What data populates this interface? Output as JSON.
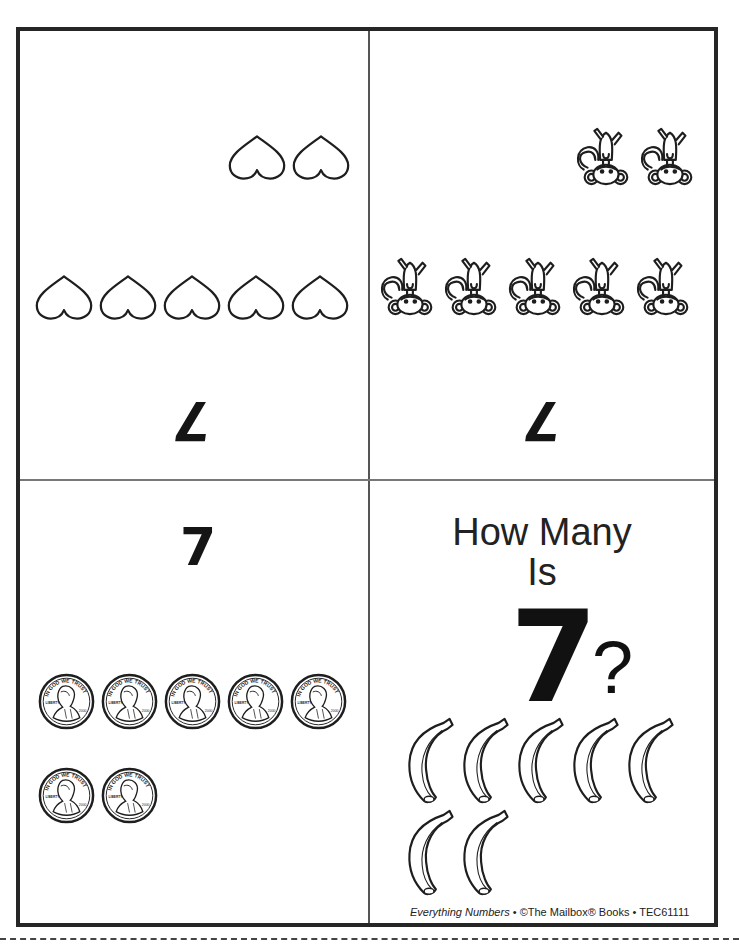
{
  "page": {
    "type": "printable counting book pages",
    "number": "7",
    "cut_line": "dashed"
  },
  "panels": {
    "top_left": {
      "orientation": "upside-down",
      "item": "heart",
      "item_icon": "heart-outline-icon",
      "rows": [
        2,
        5
      ],
      "count": 7,
      "numeral": "7"
    },
    "top_right": {
      "orientation": "upside-down",
      "item": "monkey",
      "item_icon": "monkey-icon",
      "rows": [
        2,
        5
      ],
      "count": 7,
      "numeral": "7"
    },
    "bottom_left": {
      "orientation": "upright",
      "numeral": "7",
      "item": "penny",
      "item_icon": "penny-coin-icon",
      "coin_text_top": "IN GOD WE TRUST",
      "coin_text_left": "LIBERTY",
      "coin_text_year": "2000",
      "rows": [
        5,
        2
      ],
      "count": 7
    },
    "bottom_right": {
      "orientation": "upright",
      "title_line1": "How Many",
      "title_line2": "Is",
      "numeral": "7",
      "question_mark": "?",
      "item": "banana",
      "item_icon": "banana-icon",
      "rows": [
        5,
        2
      ],
      "count": 7
    }
  },
  "footer": {
    "book_title": "Everything Numbers",
    "separator": "•",
    "publisher": "©The Mailbox® Books",
    "code": "TEC61111"
  },
  "colors": {
    "border": "#262626",
    "ink": "#1a1a1a",
    "paper": "#ffffff"
  }
}
